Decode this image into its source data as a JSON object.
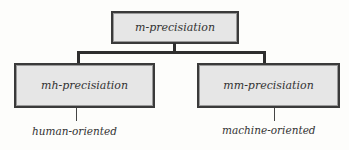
{
  "diagram": {
    "type": "hierarchy",
    "root": {
      "label": "m-precisiation"
    },
    "children": [
      {
        "label": "mh-precisiation",
        "annotation": "human-oriented"
      },
      {
        "label": "mm-precisiation",
        "annotation": "machine-oriented"
      }
    ],
    "colors": {
      "box_fill": "#e6e6e6",
      "box_border": "#3a3a3a",
      "connector": "#2e2e2e",
      "text": "#333333",
      "background": "#fdfdfb"
    }
  }
}
